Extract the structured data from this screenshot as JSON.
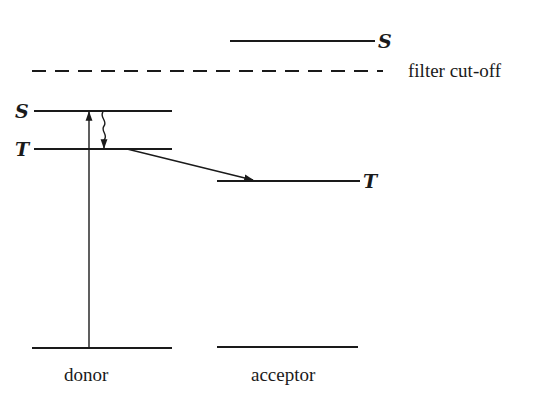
{
  "diagram": {
    "type": "energy-level diagram",
    "columns": {
      "donor": {
        "label": "donor"
      },
      "acceptor": {
        "label": "acceptor"
      }
    },
    "levels": {
      "donor_singlet": {
        "label": "S"
      },
      "donor_triplet": {
        "label": "T"
      },
      "acceptor_singlet": {
        "label": "S"
      },
      "acceptor_triplet": {
        "label": "T"
      }
    },
    "filter": {
      "label": "filter cut-off"
    },
    "transitions": [
      {
        "name": "excitation",
        "from": "donor ground",
        "to": "donor S",
        "style": "straight arrow"
      },
      {
        "name": "intersystem-crossing",
        "from": "donor S",
        "to": "donor T",
        "style": "wavy arrow"
      },
      {
        "name": "energy-transfer",
        "from": "donor T",
        "to": "acceptor T",
        "style": "straight arrow"
      }
    ],
    "colors": {
      "ink": "#1a1a1a",
      "background": "#ffffff"
    }
  }
}
